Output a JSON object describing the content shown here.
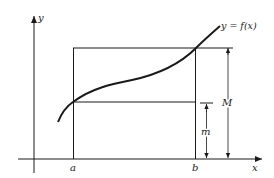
{
  "figure": {
    "colors": {
      "ink": "#1a1a1a",
      "background": "#ffffff"
    },
    "labels": {
      "y_axis": "y",
      "x_axis": "x",
      "curve": "y = f(x)",
      "a": "a",
      "b": "b",
      "M": "M",
      "m": "m"
    }
  }
}
